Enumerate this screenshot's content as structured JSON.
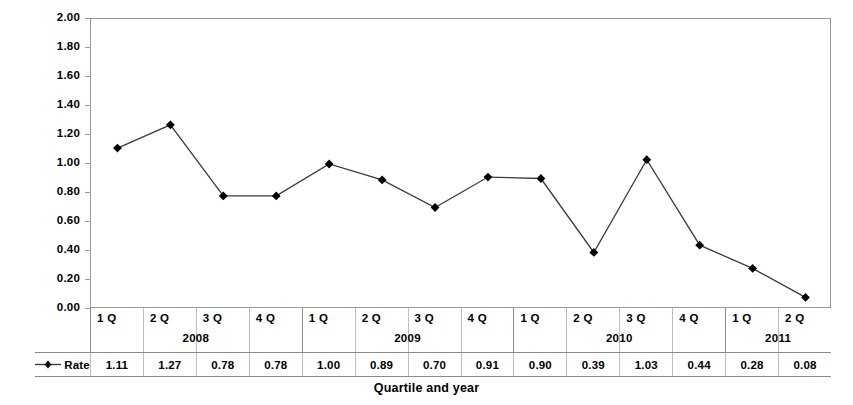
{
  "chart_data": {
    "type": "line",
    "title": "",
    "xlabel": "Quartile and year",
    "ylabel": "",
    "ylim": [
      0.0,
      2.0
    ],
    "ytick_step": 0.2,
    "ytick_labels": [
      "2.00",
      "1.80",
      "1.60",
      "1.40",
      "1.20",
      "1.00",
      "0.80",
      "0.60",
      "0.40",
      "0.20",
      "0.00"
    ],
    "grid": false,
    "legend_position": "table-left",
    "series": [
      {
        "name": "Rate",
        "marker": "diamond",
        "color": "#000000",
        "values": [
          1.11,
          1.27,
          0.78,
          0.78,
          1.0,
          0.89,
          0.7,
          0.91,
          0.9,
          0.39,
          1.03,
          0.44,
          0.28,
          0.08
        ]
      }
    ],
    "categories": [
      "1 Q",
      "2 Q",
      "3 Q",
      "4 Q",
      "1 Q",
      "2 Q",
      "3 Q",
      "4 Q",
      "1 Q",
      "2 Q",
      "3 Q",
      "4 Q",
      "1 Q",
      "2 Q"
    ],
    "value_labels": [
      "1.11",
      "1.27",
      "0.78",
      "0.78",
      "1.00",
      "0.89",
      "0.70",
      "0.91",
      "0.90",
      "0.39",
      "1.03",
      "0.44",
      "0.28",
      "0.08"
    ],
    "year_groups": [
      {
        "label": "2008",
        "start_index": 0,
        "count": 4
      },
      {
        "label": "2009",
        "start_index": 4,
        "count": 4
      },
      {
        "label": "2010",
        "start_index": 8,
        "count": 4
      },
      {
        "label": "2011",
        "start_index": 12,
        "count": 2
      }
    ]
  },
  "axis": {
    "x_title": "Quartile and year"
  },
  "legend": {
    "series_label": "Rate"
  },
  "colors": {
    "line": "#3b3b3b",
    "marker": "#000000",
    "frame": "#9a9a9a",
    "grid_divider": "#bdbdbd",
    "background": "#ffffff"
  }
}
